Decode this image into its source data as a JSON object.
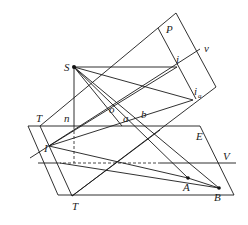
{
  "diagram": {
    "type": "perspective-projection-geometry",
    "labels": {
      "S": "S",
      "P": "P",
      "i": "i",
      "v": "v",
      "i_a": "i",
      "i_a_sub": "a",
      "o": "o",
      "a": "a",
      "b": "b",
      "T_top": "T",
      "n": "n",
      "E": "E",
      "I": "I",
      "V": "V",
      "A": "A",
      "B": "B",
      "T_bottom": "T"
    },
    "points": {
      "S": [
        74,
        67
      ],
      "i": [
        177,
        67
      ],
      "i_a": [
        193,
        100
      ],
      "A": [
        188,
        178
      ],
      "B": [
        219,
        188
      ],
      "I": [
        49,
        146
      ],
      "T_top": [
        40,
        126
      ],
      "T_bottom": [
        72,
        196
      ],
      "n": [
        74,
        126
      ]
    },
    "planes": {
      "P": "picture plane",
      "E": "ground plane"
    }
  }
}
